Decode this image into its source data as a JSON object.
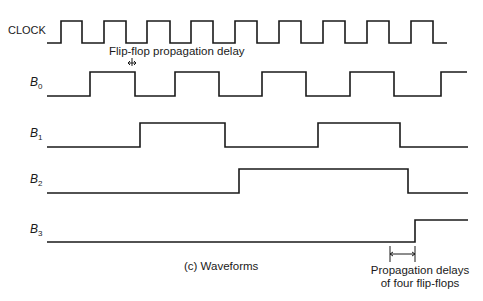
{
  "title": "(c) Waveforms",
  "signals": [
    {
      "name": "CLOCK",
      "sub": "",
      "high_y": 21,
      "low_y": 43,
      "start_x": 47,
      "end_x": 447,
      "initial": 0,
      "edges": [
        61,
        82,
        104,
        126,
        147,
        170,
        191,
        213,
        235,
        257,
        279,
        301,
        323,
        345,
        367,
        389,
        411,
        433
      ]
    },
    {
      "name": "B",
      "sub": "0",
      "high_y": 72,
      "low_y": 96,
      "start_x": 47,
      "end_x": 467,
      "initial": 0,
      "edges": [
        90,
        135,
        175,
        219,
        262,
        306,
        350,
        394,
        441
      ]
    },
    {
      "name": "B",
      "sub": "1",
      "high_y": 123,
      "low_y": 147,
      "start_x": 47,
      "end_x": 468,
      "initial": 0,
      "edges": [
        140,
        225,
        318,
        400
      ]
    },
    {
      "name": "B",
      "sub": "2",
      "high_y": 169,
      "low_y": 193,
      "start_x": 47,
      "end_x": 468,
      "initial": 0,
      "edges": [
        239,
        408
      ]
    },
    {
      "name": "B",
      "sub": "3",
      "high_y": 220,
      "low_y": 242,
      "start_x": 47,
      "end_x": 468,
      "initial": 0,
      "edges": [
        415
      ]
    }
  ],
  "annotations": {
    "flipflop_delay": "Flip-flop propagation delay",
    "four_delays_line1": "Propagation delays",
    "four_delays_line2": "of four flip-flops"
  },
  "chart_data": {
    "type": "timing-diagram",
    "title": "(c) Waveforms",
    "signals": [
      "CLOCK",
      "B0",
      "B1",
      "B2",
      "B3"
    ],
    "annotations": [
      "Flip-flop propagation delay",
      "Propagation delays of four flip-flops"
    ]
  }
}
